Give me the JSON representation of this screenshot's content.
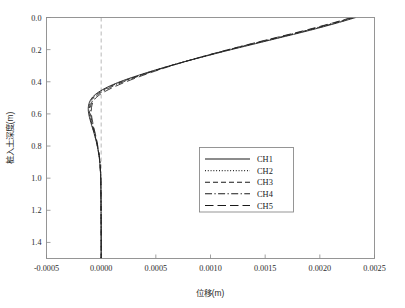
{
  "chart_data": {
    "type": "line",
    "title": "",
    "xlabel": "位移(m)",
    "ylabel": "桩入土深度(m)",
    "xlim": [
      -0.0005,
      0.0025
    ],
    "ylim": [
      0.0,
      1.5
    ],
    "y_inverted": true,
    "grid": false,
    "legend_position": "center-right",
    "reference_line": {
      "axis": "x",
      "value": 0.0,
      "style": "dashed",
      "color": "#b0b0b0"
    },
    "xticks": [
      -0.0005,
      0.0,
      0.0005,
      0.001,
      0.0015,
      0.002,
      0.0025
    ],
    "xtick_labels": [
      "-0.0005",
      "0.0000",
      "0.0005",
      "0.0010",
      "0.0015",
      "0.0020",
      "0.0025"
    ],
    "yticks": [
      0.0,
      0.2,
      0.4,
      0.6,
      0.8,
      1.0,
      1.2,
      1.4
    ],
    "ytick_labels": [
      "0.0",
      "0.2",
      "0.4",
      "0.6",
      "0.8",
      "1.0",
      "1.2",
      "1.4"
    ],
    "series": [
      {
        "name": "CH1",
        "style": "solid",
        "points": [
          [
            0.00233,
            0.0
          ],
          [
            0.00218,
            0.03
          ],
          [
            0.00202,
            0.06
          ],
          [
            0.00185,
            0.09
          ],
          [
            0.00167,
            0.12
          ],
          [
            0.00149,
            0.15
          ],
          [
            0.00131,
            0.18
          ],
          [
            0.00113,
            0.21
          ],
          [
            0.00096,
            0.24
          ],
          [
            0.00079,
            0.27
          ],
          [
            0.00063,
            0.3
          ],
          [
            0.00048,
            0.33
          ],
          [
            0.00034,
            0.36
          ],
          [
            0.00021,
            0.39
          ],
          [
            0.0001,
            0.42
          ],
          [
            1e-05,
            0.45
          ],
          [
            -5.5e-05,
            0.48
          ],
          [
            -9.5e-05,
            0.51
          ],
          [
            -0.000115,
            0.545
          ],
          [
            -0.000118,
            0.58
          ],
          [
            -0.000108,
            0.62
          ],
          [
            -9.2e-05,
            0.66
          ],
          [
            -7.4e-05,
            0.7
          ],
          [
            -5.7e-05,
            0.74
          ],
          [
            -4.2e-05,
            0.78
          ],
          [
            -3e-05,
            0.82
          ],
          [
            -2e-05,
            0.86
          ],
          [
            -1.3e-05,
            0.9
          ],
          [
            -8e-06,
            0.95
          ],
          [
            -4e-06,
            1.0
          ],
          [
            -2e-06,
            1.1
          ],
          [
            -1e-06,
            1.2
          ],
          [
            0.0,
            1.35
          ],
          [
            0.0,
            1.5
          ]
        ]
      },
      {
        "name": "CH2",
        "style": "dotted",
        "points": [
          [
            0.00232,
            0.0
          ],
          [
            0.00217,
            0.03
          ],
          [
            0.00201,
            0.06
          ],
          [
            0.00184,
            0.09
          ],
          [
            0.00166,
            0.12
          ],
          [
            0.00148,
            0.15
          ],
          [
            0.0013,
            0.18
          ],
          [
            0.001125,
            0.21
          ],
          [
            0.000955,
            0.24
          ],
          [
            0.00079,
            0.27
          ],
          [
            0.000632,
            0.3
          ],
          [
            0.000484,
            0.33
          ],
          [
            0.000346,
            0.36
          ],
          [
            0.000218,
            0.39
          ],
          [
            0.000105,
            0.42
          ],
          [
            1.4e-05,
            0.45
          ],
          [
            -5e-05,
            0.48
          ],
          [
            -9e-05,
            0.51
          ],
          [
            -0.00011,
            0.545
          ],
          [
            -0.000113,
            0.58
          ],
          [
            -0.000104,
            0.62
          ],
          [
            -8.9e-05,
            0.66
          ],
          [
            -7.2e-05,
            0.7
          ],
          [
            -5.6e-05,
            0.74
          ],
          [
            -4.1e-05,
            0.78
          ],
          [
            -2.9e-05,
            0.82
          ],
          [
            -1.9e-05,
            0.86
          ],
          [
            -1.2e-05,
            0.9
          ],
          [
            -7e-06,
            0.95
          ],
          [
            -4e-06,
            1.0
          ],
          [
            -2e-06,
            1.1
          ],
          [
            -1e-06,
            1.2
          ],
          [
            0.0,
            1.35
          ],
          [
            0.0,
            1.5
          ]
        ]
      },
      {
        "name": "CH3",
        "style": "dashed",
        "points": [
          [
            0.00231,
            0.0
          ],
          [
            0.00216,
            0.03
          ],
          [
            0.002,
            0.06
          ],
          [
            0.00183,
            0.09
          ],
          [
            0.00165,
            0.12
          ],
          [
            0.00147,
            0.15
          ],
          [
            0.00129,
            0.18
          ],
          [
            0.001118,
            0.21
          ],
          [
            0.00095,
            0.24
          ],
          [
            0.000788,
            0.27
          ],
          [
            0.000634,
            0.3
          ],
          [
            0.000489,
            0.33
          ],
          [
            0.000353,
            0.36
          ],
          [
            0.000227,
            0.39
          ],
          [
            0.000114,
            0.42
          ],
          [
            2.2e-05,
            0.45
          ],
          [
            -4.3e-05,
            0.48
          ],
          [
            -8.4e-05,
            0.51
          ],
          [
            -0.000104,
            0.545
          ],
          [
            -0.000108,
            0.58
          ],
          [
            -0.0001,
            0.62
          ],
          [
            -8.6e-05,
            0.66
          ],
          [
            -7e-05,
            0.7
          ],
          [
            -5.4e-05,
            0.74
          ],
          [
            -4e-05,
            0.78
          ],
          [
            -2.8e-05,
            0.82
          ],
          [
            -1.9e-05,
            0.86
          ],
          [
            -1.2e-05,
            0.9
          ],
          [
            -7e-06,
            0.95
          ],
          [
            -4e-06,
            1.0
          ],
          [
            -2e-06,
            1.1
          ],
          [
            -1e-06,
            1.2
          ],
          [
            0.0,
            1.35
          ],
          [
            0.0,
            1.5
          ]
        ]
      },
      {
        "name": "CH4",
        "style": "dashdot",
        "points": [
          [
            0.0023,
            0.0
          ],
          [
            0.002148,
            0.03
          ],
          [
            0.001988,
            0.06
          ],
          [
            0.001818,
            0.09
          ],
          [
            0.00164,
            0.12
          ],
          [
            0.00146,
            0.15
          ],
          [
            0.001282,
            0.18
          ],
          [
            0.00111,
            0.21
          ],
          [
            0.000946,
            0.24
          ],
          [
            0.000788,
            0.27
          ],
          [
            0.000638,
            0.3
          ],
          [
            0.000497,
            0.33
          ],
          [
            0.000365,
            0.36
          ],
          [
            0.000243,
            0.39
          ],
          [
            0.000133,
            0.42
          ],
          [
            4e-05,
            0.45
          ],
          [
            -3e-05,
            0.48
          ],
          [
            -7.2e-05,
            0.51
          ],
          [
            -9.4e-05,
            0.545
          ],
          [
            -9.9e-05,
            0.58
          ],
          [
            -9.3e-05,
            0.62
          ],
          [
            -8.1e-05,
            0.66
          ],
          [
            -6.6e-05,
            0.7
          ],
          [
            -5.1e-05,
            0.74
          ],
          [
            -3.8e-05,
            0.78
          ],
          [
            -2.7e-05,
            0.82
          ],
          [
            -1.8e-05,
            0.86
          ],
          [
            -1.1e-05,
            0.9
          ],
          [
            -7e-06,
            0.95
          ],
          [
            -3e-06,
            1.0
          ],
          [
            -2e-06,
            1.1
          ],
          [
            -1e-06,
            1.2
          ],
          [
            0.0,
            1.35
          ],
          [
            0.0,
            1.5
          ]
        ]
      },
      {
        "name": "CH5",
        "style": "longdash",
        "points": [
          [
            0.00229,
            0.0
          ],
          [
            0.002138,
            0.03
          ],
          [
            0.001976,
            0.06
          ],
          [
            0.001806,
            0.09
          ],
          [
            0.001628,
            0.12
          ],
          [
            0.00145,
            0.15
          ],
          [
            0.001275,
            0.18
          ],
          [
            0.001105,
            0.21
          ],
          [
            0.000944,
            0.24
          ],
          [
            0.00079,
            0.27
          ],
          [
            0.000645,
            0.3
          ],
          [
            0.00051,
            0.33
          ],
          [
            0.000383,
            0.36
          ],
          [
            0.000265,
            0.39
          ],
          [
            0.000158,
            0.42
          ],
          [
            6.4e-05,
            0.45
          ],
          [
            -1.2e-05,
            0.48
          ],
          [
            -6e-05,
            0.51
          ],
          [
            -8.4e-05,
            0.545
          ],
          [
            -9e-05,
            0.58
          ],
          [
            -8.6e-05,
            0.62
          ],
          [
            -7.5e-05,
            0.66
          ],
          [
            -6.2e-05,
            0.7
          ],
          [
            -4.8e-05,
            0.74
          ],
          [
            -3.6e-05,
            0.78
          ],
          [
            -2.6e-05,
            0.82
          ],
          [
            -1.7e-05,
            0.86
          ],
          [
            -1.1e-05,
            0.9
          ],
          [
            -6e-06,
            0.95
          ],
          [
            -3e-06,
            1.0
          ],
          [
            -2e-06,
            1.1
          ],
          [
            -1e-06,
            1.2
          ],
          [
            0.0,
            1.35
          ],
          [
            0.0,
            1.5
          ]
        ]
      }
    ]
  },
  "legend": {
    "entries": [
      {
        "label": "CH1"
      },
      {
        "label": "CH2"
      },
      {
        "label": "CH3"
      },
      {
        "label": "CH4"
      },
      {
        "label": "CH5"
      }
    ]
  }
}
